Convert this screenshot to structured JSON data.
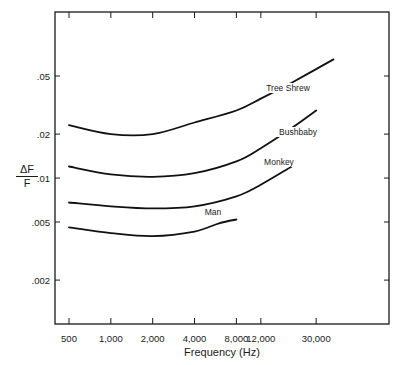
{
  "chart_data": {
    "type": "line",
    "title": "",
    "xlabel": "Frequency (Hz)",
    "ylabel": "ΔF / F",
    "xscale": "log",
    "yscale": "log",
    "xlim": [
      420,
      60000
    ],
    "ylim": [
      0.0013,
      0.13
    ],
    "grid": false,
    "legend": "inline labels on curves",
    "x_ticks": [
      500,
      1000,
      2000,
      4000,
      8000,
      12000,
      30000
    ],
    "x_tick_labels": [
      "500",
      "1,000",
      "2,000",
      "4,000",
      "8,000",
      "12,000",
      "30,000"
    ],
    "y_ticks": [
      0.05,
      0.02,
      0.01,
      0.005,
      0.002
    ],
    "y_tick_labels": [
      ".05",
      ".02",
      ".01",
      ".005",
      ".002"
    ],
    "series": [
      {
        "name": "Tree Shrew",
        "x": [
          500,
          1000,
          2000,
          4000,
          8000,
          12000,
          20000,
          40000
        ],
        "values": [
          0.023,
          0.02,
          0.02,
          0.024,
          0.029,
          0.035,
          0.045,
          0.065
        ]
      },
      {
        "name": "Bushbaby",
        "x": [
          500,
          1000,
          2000,
          4000,
          8000,
          12000,
          20000,
          30000
        ],
        "values": [
          0.012,
          0.0106,
          0.0102,
          0.0108,
          0.013,
          0.016,
          0.022,
          0.029
        ]
      },
      {
        "name": "Monkey",
        "x": [
          500,
          1000,
          2000,
          4000,
          8000,
          12000,
          20000
        ],
        "values": [
          0.0068,
          0.0064,
          0.0062,
          0.0064,
          0.0075,
          0.009,
          0.012
        ]
      },
      {
        "name": "Man",
        "x": [
          500,
          1000,
          2000,
          4000,
          6000,
          8000
        ],
        "values": [
          0.0046,
          0.0042,
          0.004,
          0.0043,
          0.0049,
          0.0052
        ]
      }
    ]
  },
  "labels": {
    "ylabel_numerator": "ΔF",
    "ylabel_denominator": "F",
    "xlabel": "Frequency (Hz)",
    "series_labels": [
      "Tree Shrew",
      "Bushbaby",
      "Monkey",
      "Man"
    ]
  }
}
